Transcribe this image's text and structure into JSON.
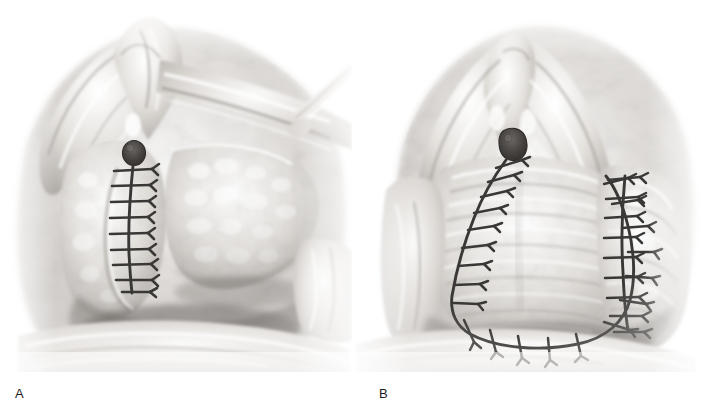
{
  "figure": {
    "style": "grayscale medical line-and-tone illustration",
    "background_color": "#ffffff",
    "suture_color": "#3a3836",
    "tissue_light": "#f2f1ef",
    "tissue_mid": "#c9c6c2",
    "tissue_dark": "#6e6a66",
    "orifice_color": "#444140",
    "width": 703,
    "height": 411
  },
  "panels": [
    {
      "id": "panel-a",
      "label": "A",
      "label_x": 15,
      "label_y": 386,
      "description": "Perineal view with retracted flap; vertical midline suture line with transverse interrupted stitches and a dark round orifice at its apex",
      "orifice": {
        "cx": 134,
        "cy": 153,
        "rx": 11,
        "ry": 12
      },
      "suture_line": {
        "type": "vertical",
        "x": 131,
        "y_top": 166,
        "y_bottom": 292,
        "stitch_count": 9
      },
      "retractor": {
        "present": true,
        "side": "upper-right"
      },
      "flap": {
        "present": true,
        "side": "right",
        "retracted": true
      }
    },
    {
      "id": "panel-b",
      "label": "B",
      "label_x": 379,
      "label_y": 386,
      "description": "Completed repair: broad U-shaped (horseshoe) suture line with radiating interrupted stitches, plus a separate lateral vertical suture line on the right; dark round orifice at the apex",
      "orifice": {
        "cx": 514,
        "cy": 143,
        "rx": 12,
        "ry": 13
      },
      "suture_line_main": {
        "type": "u-curve",
        "stitch_count": 18
      },
      "suture_line_lateral": {
        "type": "vertical",
        "x": 625,
        "y_top": 176,
        "y_bottom": 330,
        "stitch_count": 9
      }
    }
  ],
  "labels": {
    "a": "A",
    "b": "B"
  }
}
